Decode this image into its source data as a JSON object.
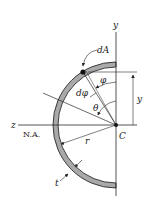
{
  "diagram": {
    "labels": {
      "y_axis": "y",
      "z_axis": "z",
      "neutral_axis": "N.A.",
      "centroid": "C",
      "area_element": "dA",
      "angle_phi": "φ",
      "angle_dphi": "dφ",
      "angle_theta": "θ",
      "radius": "r",
      "thickness": "t",
      "y_dimension": "y"
    },
    "colors": {
      "wall_fill": "#a9a9a9",
      "wall_stroke": "#2a2a2a",
      "line": "#2a2a2a",
      "background": "#ffffff"
    }
  }
}
